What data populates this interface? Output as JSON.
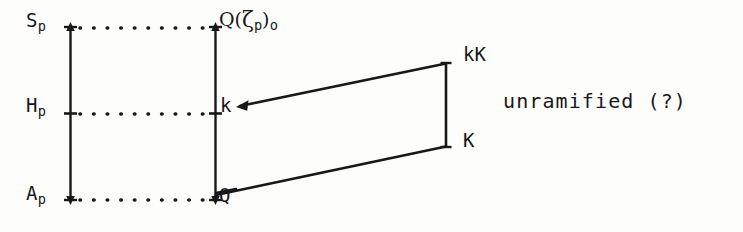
{
  "figure": {
    "type": "mathematical-diagram",
    "background_color": "#fdfdfc",
    "ink_color": "#181818"
  },
  "left_column": {
    "items": [
      {
        "id": "sp",
        "label": "S",
        "subscript": "p",
        "row": "top"
      },
      {
        "id": "hp",
        "label": "H",
        "subscript": "p",
        "row": "middle"
      },
      {
        "id": "ap",
        "label": "A",
        "subscript": "p",
        "row": "bottom"
      }
    ]
  },
  "right_column": {
    "items": [
      {
        "id": "qzeta",
        "label": "Q(",
        "zeta": "ζ",
        "subscript": "p",
        "close": ")",
        "outer_subscript": "o",
        "row": "top"
      },
      {
        "id": "k",
        "label": "k",
        "row": "middle"
      },
      {
        "id": "q",
        "label": "Q",
        "row": "bottom"
      }
    ]
  },
  "quadrilateral": {
    "corners": [
      {
        "id": "kK",
        "label": "kK",
        "position": "top-right"
      },
      {
        "id": "K",
        "label": "K",
        "position": "bottom-right"
      }
    ]
  },
  "annotations": {
    "note": "unramified (?)"
  },
  "dotted_rows": {
    "count": 3,
    "dots_per_row": 10
  }
}
